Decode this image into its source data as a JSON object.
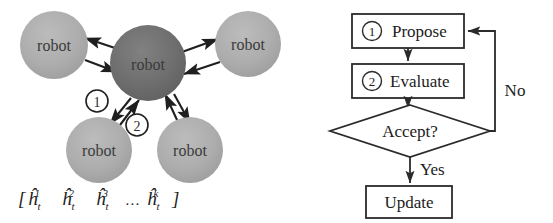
{
  "figure": {
    "background_color": "#ffffff",
    "panels": [
      {
        "id": "swarm",
        "name": "multi-robot-communication-panel"
      },
      {
        "id": "flowchart",
        "name": "propose-evaluate-flowchart-panel"
      }
    ]
  },
  "swarm": {
    "robot_label": "robot",
    "center_color": "#6e6e6e",
    "peripheral_color": "#adadad",
    "nodes": [
      {
        "id": "center",
        "label": "robot",
        "role": "center",
        "cx": 148,
        "cy": 63,
        "r": 38,
        "fill": "#6e6e6e"
      },
      {
        "id": "top-left",
        "label": "robot",
        "role": "peripheral",
        "cx": 54,
        "cy": 45,
        "r": 34,
        "fill": "#adadad"
      },
      {
        "id": "top-right",
        "label": "robot",
        "role": "peripheral",
        "cx": 248,
        "cy": 44,
        "r": 33,
        "fill": "#adadad"
      },
      {
        "id": "bottom-left",
        "label": "robot",
        "role": "peripheral",
        "cx": 99,
        "cy": 150,
        "r": 33,
        "fill": "#adadad"
      },
      {
        "id": "bottom-right",
        "label": "robot",
        "role": "peripheral",
        "cx": 190,
        "cy": 150,
        "r": 33,
        "fill": "#adadad"
      }
    ],
    "step_markers": [
      {
        "id": "step-1",
        "label": "1",
        "cx": 97,
        "cy": 101,
        "r": 11
      },
      {
        "id": "step-2",
        "label": "2",
        "cx": 137,
        "cy": 125,
        "r": 11
      }
    ],
    "state_vector": "[ĥₜ¹ ĥₜ² ĥₜ³ … ĥₜᵏ]",
    "state_vector_parts": {
      "open_bracket": "[",
      "close_bracket": "]",
      "symbol": "ĥ",
      "subscript": "t",
      "superscripts": [
        "1",
        "2",
        "3",
        "k"
      ],
      "ellipsis": "…"
    }
  },
  "flowchart": {
    "line_color": "#2b2b2b",
    "box_fill": "#ffffff",
    "nodes": [
      {
        "id": "propose",
        "kind": "process",
        "marker": "1",
        "label": "Propose",
        "x": 352,
        "y": 14,
        "w": 112,
        "h": 34
      },
      {
        "id": "evaluate",
        "kind": "process",
        "marker": "2",
        "label": "Evaluate",
        "x": 352,
        "y": 64,
        "w": 112,
        "h": 34
      },
      {
        "id": "accept",
        "kind": "decision",
        "marker": "",
        "label": "Accept?",
        "cx": 410,
        "cy": 131,
        "hw": 80,
        "hh": 26
      },
      {
        "id": "update",
        "kind": "process",
        "marker": "",
        "label": "Update",
        "x": 366,
        "y": 186,
        "w": 86,
        "h": 32
      }
    ],
    "edge_labels": [
      {
        "id": "no-label",
        "label": "No",
        "x": 515,
        "y": 90
      },
      {
        "id": "yes-label",
        "label": "Yes",
        "x": 420,
        "y": 172
      }
    ]
  }
}
